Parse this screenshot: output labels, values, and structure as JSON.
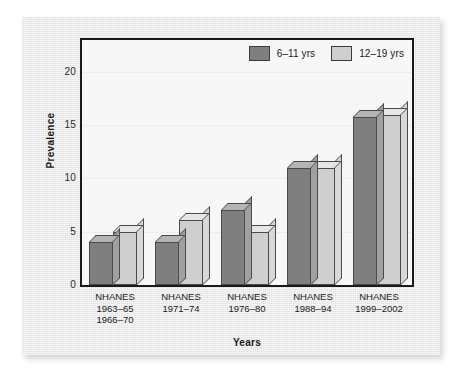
{
  "chart_data": {
    "type": "bar",
    "title": "",
    "xlabel": "Years",
    "ylabel": "Prevalence",
    "ylim": [
      0,
      23
    ],
    "yticks": [
      0,
      5,
      10,
      15,
      20
    ],
    "ytick_labels": [
      "0",
      "5",
      "10",
      "15",
      "20"
    ],
    "grid": true,
    "legend_position": "top-right",
    "categories": [
      "NHANES\n1963–65\n1966–70",
      "NHANES\n1971–74",
      "NHANES\n1976–80",
      "NHANES\n1988–94",
      "NHANES\n1999–2002"
    ],
    "category_lines": [
      [
        "NHANES",
        "1963–65",
        "1966–70"
      ],
      [
        "NHANES",
        "1971–74"
      ],
      [
        "NHANES",
        "1976–80"
      ],
      [
        "NHANES",
        "1988–94"
      ],
      [
        "NHANES",
        "1999–2002"
      ]
    ],
    "series": [
      {
        "name": "6–11 yrs",
        "color": "#7f7f7f",
        "values": [
          4,
          4,
          7,
          11,
          15.8
        ]
      },
      {
        "name": "12–19 yrs",
        "color": "#cfcfcf",
        "values": [
          5,
          6.1,
          5,
          11,
          16
        ]
      }
    ]
  },
  "legend": {
    "entries": [
      {
        "label": "6–11 yrs",
        "swatch": "dark-gray-swatch"
      },
      {
        "label": "12–19 yrs",
        "swatch": "light-gray-swatch"
      }
    ]
  },
  "axes": {
    "y_title": "Prevalence",
    "x_title": "Years"
  }
}
